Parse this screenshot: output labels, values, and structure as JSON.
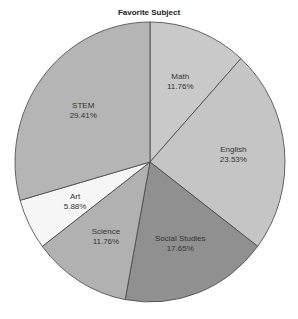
{
  "chart_data": {
    "type": "pie",
    "title": "Favorite Subject",
    "categories": [
      "Math",
      "English",
      "Social Studies",
      "Science",
      "Art",
      "STEM"
    ],
    "values": [
      11.76,
      23.53,
      17.65,
      11.76,
      5.88,
      29.41
    ],
    "value_labels": [
      "11.76%",
      "23.53%",
      "17.65%",
      "11.76%",
      "5.88%",
      "29.41%"
    ],
    "colors": [
      "#c9c9c9",
      "#c5c5c5",
      "#909090",
      "#b1b1b1",
      "#f6f6f6",
      "#b5b5b5"
    ],
    "start_angle": "top, clockwise",
    "legend": "none"
  }
}
